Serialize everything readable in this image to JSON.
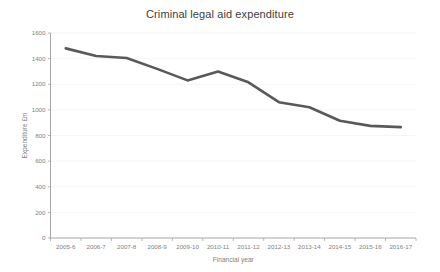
{
  "chart_data": {
    "type": "line",
    "title": "Criminal legal aid expenditure",
    "xlabel": "Financial year",
    "ylabel": "Expenditure £m",
    "categories": [
      "2005-6",
      "2006-7",
      "2007-8",
      "2008-9",
      "2009-10",
      "2010-11",
      "2011-12",
      "2012-13",
      "2013-14",
      "2014-15",
      "2015-16",
      "2016-17"
    ],
    "values": [
      1480,
      1420,
      1405,
      1320,
      1230,
      1300,
      1215,
      1060,
      1020,
      915,
      875,
      865
    ],
    "series": [
      {
        "name": "Criminal legal aid expenditure",
        "values": [
          1480,
          1420,
          1405,
          1320,
          1230,
          1300,
          1215,
          1060,
          1020,
          915,
          875,
          865
        ]
      }
    ],
    "ylim": [
      0,
      1600
    ],
    "yticks": [
      0,
      200,
      400,
      600,
      800,
      1000,
      1200,
      1400,
      1600
    ],
    "ytick_labels": [
      "0",
      "200",
      "400",
      "600",
      "800",
      "1000",
      "1200",
      "1400",
      "1600"
    ],
    "grid": true,
    "grid_axis": "y",
    "legend": false,
    "legend_position": "none",
    "line_color": "#595959",
    "gridline_color": "#f2f2f2",
    "axis_color": "#a6a6a6",
    "background_color": "#ffffff",
    "text_color": "#7f7f7f",
    "title_color": "#404040"
  }
}
